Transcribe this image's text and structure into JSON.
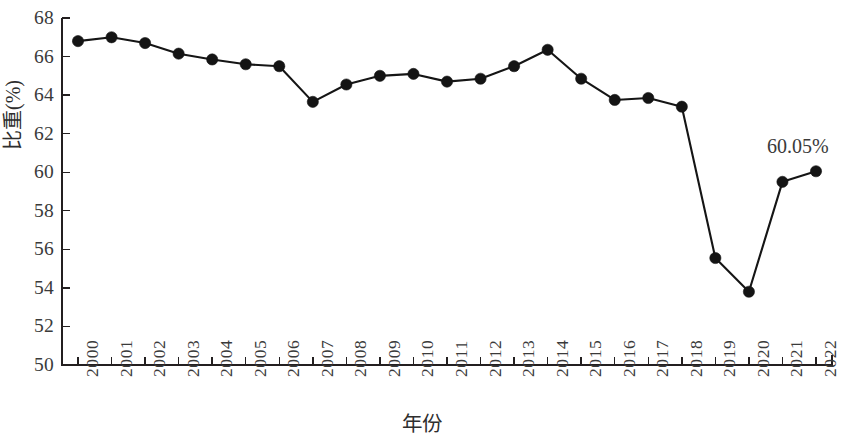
{
  "chart_data": {
    "type": "line",
    "title": "",
    "subtitle": "",
    "xlabel": "年份",
    "ylabel": "比重(%)",
    "categories": [
      "2000",
      "2001",
      "2002",
      "2003",
      "2004",
      "2005",
      "2006",
      "2007",
      "2008",
      "2009",
      "2010",
      "2011",
      "2012",
      "2013",
      "2014",
      "2015",
      "2016",
      "2017",
      "2018",
      "2019",
      "2020",
      "2021",
      "2022"
    ],
    "values": [
      66.8,
      67.0,
      66.7,
      66.15,
      65.85,
      65.6,
      65.5,
      63.65,
      64.55,
      65.0,
      65.1,
      64.7,
      64.85,
      65.5,
      66.35,
      64.85,
      63.75,
      63.85,
      63.4,
      55.55,
      53.8,
      59.5,
      60.05
    ],
    "ylim": [
      50,
      68
    ],
    "ytick_values": [
      50,
      52,
      54,
      56,
      58,
      60,
      62,
      64,
      66,
      68
    ],
    "ytick_labels": [
      "50",
      "52",
      "54",
      "56",
      "58",
      "60",
      "62",
      "64",
      "66",
      "68"
    ],
    "grid": false,
    "legend": "none",
    "marker": "filled-circle",
    "line_color": "#151515",
    "marker_color": "#141414",
    "annotations": [
      {
        "text": "60.05%",
        "points_to_category": "2022",
        "value": 60.05
      }
    ]
  },
  "axis": {
    "y_title": "比重(%)",
    "x_title": "年份"
  },
  "annotation": {
    "last_value_label": "60.05%"
  }
}
